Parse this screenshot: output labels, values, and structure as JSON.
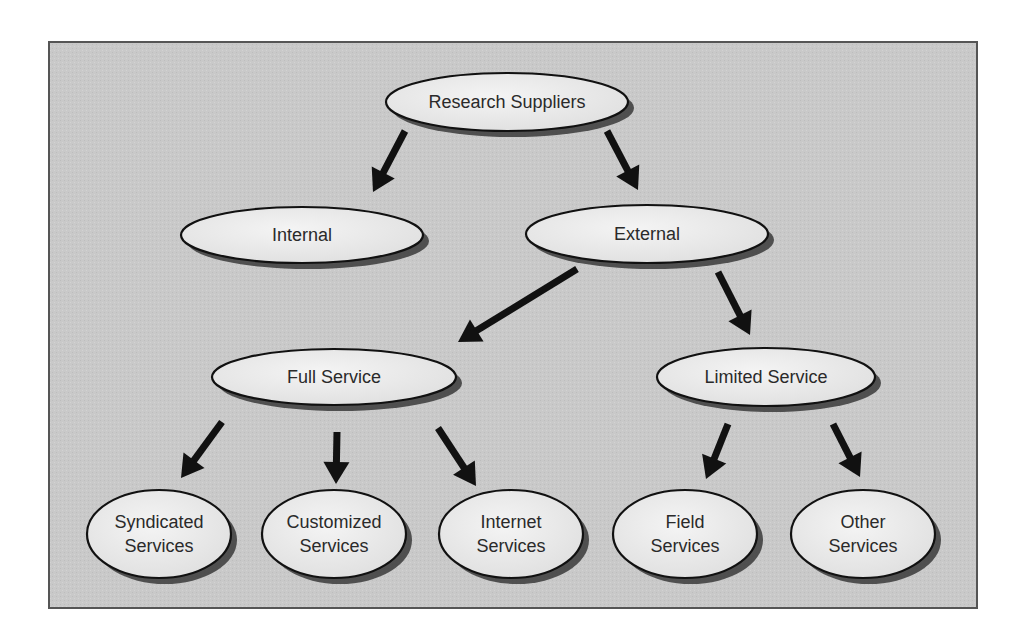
{
  "diagram": {
    "type": "hierarchy-tree",
    "panel": {
      "x": 49,
      "y": 42,
      "width": 928,
      "height": 566,
      "fill": "#c9c9c9",
      "border": "#555555"
    },
    "colors": {
      "node_fill": "#ececec",
      "node_stroke": "#111111",
      "shadow": "#3a3a3a",
      "arrow": "#111111",
      "text": "#2a2a2a"
    },
    "nodes": [
      {
        "id": "research-suppliers",
        "lines": [
          "Research Suppliers"
        ],
        "cx": 507,
        "cy": 102,
        "rx": 121,
        "ry": 29
      },
      {
        "id": "internal",
        "lines": [
          "Internal"
        ],
        "cx": 302,
        "cy": 235,
        "rx": 121,
        "ry": 28
      },
      {
        "id": "external",
        "lines": [
          "External"
        ],
        "cx": 647,
        "cy": 234,
        "rx": 121,
        "ry": 29
      },
      {
        "id": "full-service",
        "lines": [
          "Full Service"
        ],
        "cx": 334,
        "cy": 377,
        "rx": 122,
        "ry": 28
      },
      {
        "id": "limited-service",
        "lines": [
          "Limited Service"
        ],
        "cx": 766,
        "cy": 377,
        "rx": 109,
        "ry": 29
      },
      {
        "id": "syndicated-services",
        "lines": [
          "Syndicated",
          "Services"
        ],
        "cx": 159,
        "cy": 534,
        "rx": 72,
        "ry": 44
      },
      {
        "id": "customized-services",
        "lines": [
          "Customized",
          "Services"
        ],
        "cx": 334,
        "cy": 534,
        "rx": 72,
        "ry": 44
      },
      {
        "id": "internet-services",
        "lines": [
          "Internet",
          "Services"
        ],
        "cx": 511,
        "cy": 534,
        "rx": 72,
        "ry": 44
      },
      {
        "id": "field-services",
        "lines": [
          "Field",
          "Services"
        ],
        "cx": 685,
        "cy": 534,
        "rx": 72,
        "ry": 44
      },
      {
        "id": "other-services",
        "lines": [
          "Other",
          "Services"
        ],
        "cx": 863,
        "cy": 534,
        "rx": 72,
        "ry": 44
      }
    ],
    "edges": [
      {
        "from": "research-suppliers",
        "to": "internal",
        "x1": 405,
        "y1": 131,
        "x2": 373,
        "y2": 192
      },
      {
        "from": "research-suppliers",
        "to": "external",
        "x1": 607,
        "y1": 131,
        "x2": 638,
        "y2": 190
      },
      {
        "from": "external",
        "to": "full-service",
        "x1": 577,
        "y1": 269,
        "x2": 458,
        "y2": 342
      },
      {
        "from": "external",
        "to": "limited-service",
        "x1": 718,
        "y1": 272,
        "x2": 750,
        "y2": 335
      },
      {
        "from": "full-service",
        "to": "syndicated-services",
        "x1": 222,
        "y1": 422,
        "x2": 181,
        "y2": 478
      },
      {
        "from": "full-service",
        "to": "customized-services",
        "x1": 337,
        "y1": 432,
        "x2": 336,
        "y2": 484
      },
      {
        "from": "full-service",
        "to": "internet-services",
        "x1": 438,
        "y1": 428,
        "x2": 476,
        "y2": 486
      },
      {
        "from": "limited-service",
        "to": "field-services",
        "x1": 728,
        "y1": 424,
        "x2": 706,
        "y2": 479
      },
      {
        "from": "limited-service",
        "to": "other-services",
        "x1": 833,
        "y1": 424,
        "x2": 860,
        "y2": 477
      }
    ]
  }
}
